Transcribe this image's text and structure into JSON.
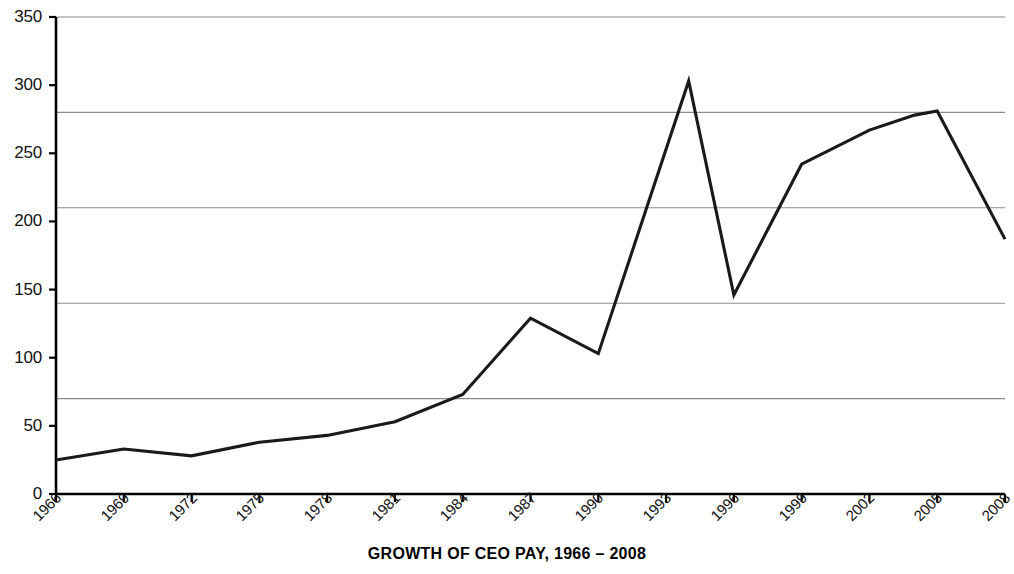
{
  "chart_data": {
    "type": "line",
    "title": "GROWTH OF CEO PAY, 1966 – 2008",
    "xlabel": "",
    "ylabel": "",
    "xlim": [
      1966,
      2008
    ],
    "ylim": [
      0,
      350
    ],
    "grid": "horizontal",
    "legend": "none",
    "y_tick_labels": [
      "0",
      "50",
      "100",
      "150",
      "200",
      "250",
      "300",
      "350"
    ],
    "y_tick_values": [
      0,
      50,
      100,
      150,
      200,
      250,
      300,
      350
    ],
    "y_gridline_values": [
      70,
      140,
      210,
      280,
      350
    ],
    "x_tick_labels": [
      "1966",
      "1969",
      "1972",
      "1975",
      "1978",
      "1981",
      "1984",
      "1987",
      "1990",
      "1993",
      "1996",
      "1999",
      "2002",
      "2005",
      "2008"
    ],
    "x_tick_values": [
      1966,
      1969,
      1972,
      1975,
      1978,
      1981,
      1984,
      1987,
      1990,
      1993,
      1996,
      1999,
      2002,
      2005,
      2008
    ],
    "series": [
      {
        "name": "CEO pay index",
        "x": [
          1966,
          1969,
          1972,
          1975,
          1978,
          1981,
          1984,
          1987,
          1990,
          1994,
          1996,
          1999,
          2002,
          2004,
          2005,
          2008
        ],
        "values": [
          25,
          33,
          28,
          38,
          43,
          53,
          73,
          129,
          103,
          303,
          146,
          242,
          267,
          278,
          281,
          187
        ],
        "color": "#1a1a1a"
      }
    ],
    "colors": {
      "line": "#1a1a1a",
      "axis": "#000000",
      "gridline": "#8c8c8c",
      "background": "#ffffff",
      "text": "#111111"
    }
  }
}
